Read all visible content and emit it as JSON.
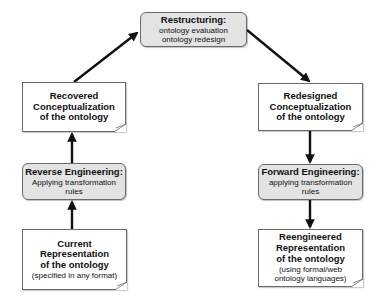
{
  "diagram": {
    "restructuring": {
      "title": "Restructuring:",
      "lines": [
        "ontology evaluation",
        "ontology redesign"
      ]
    },
    "recovered": {
      "lines": [
        "Recovered",
        "Conceptualization",
        "of the ontology"
      ]
    },
    "reverse_engineering": {
      "title": "Reverse Engineering:",
      "lines": [
        "Applying transformation",
        "rules"
      ]
    },
    "current_representation": {
      "lines": [
        "Current Representation",
        "of the ontology"
      ],
      "note": "(specified in any format)"
    },
    "redesigned": {
      "lines": [
        "Redesigned",
        "Conceptualization",
        "of the ontology"
      ]
    },
    "forward_engineering": {
      "title": "Forward Engineering:",
      "lines": [
        "applying transformation",
        "rules"
      ]
    },
    "reengineered": {
      "lines": [
        "Reengineered",
        "Representation",
        "of the ontology"
      ],
      "notes": [
        "(using formal/web",
        "ontology languages)"
      ]
    },
    "colors": {
      "process_fill": "#e3e3e3",
      "doc_fill": "#ffffff",
      "border": "#6a6a6a",
      "arrow": "#111111"
    }
  }
}
